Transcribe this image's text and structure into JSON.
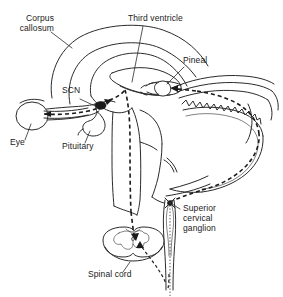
{
  "figure": {
    "type": "anatomical-diagram",
    "background_color": "#ffffff",
    "line_color": "#2b2b2b",
    "pathway_color": "#1a1a1a",
    "width": 283,
    "height": 297
  },
  "labels": {
    "corpus_callosum": "Corpus\ncallosum",
    "third_ventricle": "Third ventricle",
    "pineal": "Pineal",
    "scn": "SCN",
    "eye": "Eye",
    "pituitary": "Pituitary",
    "superior_cervical_ganglion": "Superior\ncervical\nganglion",
    "spinal_cord": "Spinal cord"
  },
  "structures": [
    {
      "name": "corpus-callosum",
      "label": "Corpus callosum"
    },
    {
      "name": "third-ventricle",
      "label": "Third ventricle"
    },
    {
      "name": "pineal-gland",
      "label": "Pineal"
    },
    {
      "name": "suprachiasmatic-nucleus",
      "label": "SCN"
    },
    {
      "name": "eye",
      "label": "Eye"
    },
    {
      "name": "pituitary-gland",
      "label": "Pituitary"
    },
    {
      "name": "superior-cervical-ganglion",
      "label": "Superior cervical ganglion"
    },
    {
      "name": "spinal-cord",
      "label": "Spinal cord"
    },
    {
      "name": "cerebellum",
      "label": ""
    },
    {
      "name": "brainstem",
      "label": ""
    },
    {
      "name": "sympathetic-chain",
      "label": ""
    }
  ],
  "pathway": {
    "name": "retino-pineal circadian pathway",
    "segments": [
      {
        "from": "Eye",
        "to": "SCN",
        "style": "dashed-hatched"
      },
      {
        "from": "SCN",
        "to": "Spinal cord",
        "style": "dashed"
      },
      {
        "from": "Spinal cord",
        "to": "Superior cervical ganglion",
        "style": "dashed"
      },
      {
        "from": "Superior cervical ganglion",
        "to": "Pineal",
        "style": "dashed"
      }
    ]
  }
}
